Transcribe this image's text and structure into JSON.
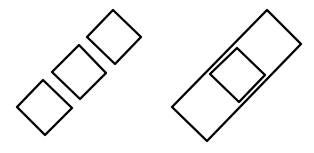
{
  "diagram": {
    "background": "#ffffff",
    "stroke_color": "#000000",
    "stroke_width": 2.4,
    "figures": [
      {
        "name": "three-separate-squares",
        "shapes": [
          {
            "name": "square-bottom",
            "points": "43,80 72,108 45,135 17,107"
          },
          {
            "name": "square-middle",
            "points": "79,45 106,73 80,99 52,72"
          },
          {
            "name": "square-top",
            "points": "113,10 141,37 115,64 87,37"
          }
        ]
      },
      {
        "name": "rectangle-with-inner-square",
        "shapes": [
          {
            "name": "outer-rectangle",
            "points": "267,10 301,44 207,141 172,107"
          },
          {
            "name": "inner-square",
            "points": "237,48 265,75 239,102 210,74"
          }
        ]
      }
    ]
  }
}
